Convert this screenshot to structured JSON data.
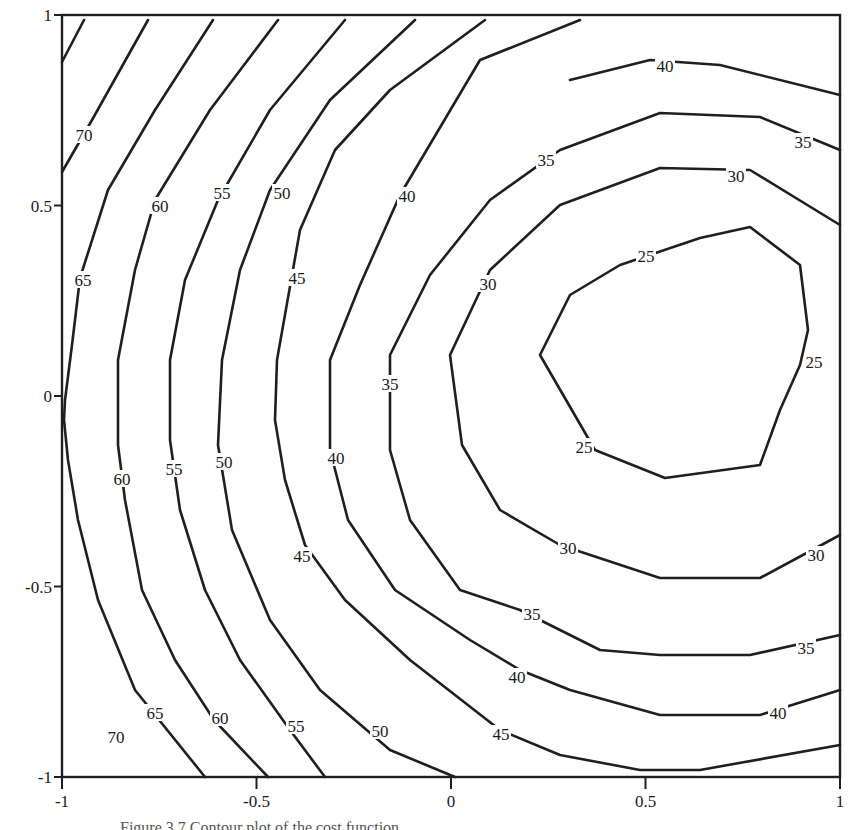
{
  "chart_data": {
    "type": "contour",
    "title": "",
    "xlabel": "",
    "ylabel": "",
    "xlim": [
      -1,
      1
    ],
    "ylim": [
      -1,
      1
    ],
    "x_ticks": [
      {
        "value": -1,
        "label": "-1"
      },
      {
        "value": -0.5,
        "label": "-0.5"
      },
      {
        "value": 0,
        "label": "0"
      },
      {
        "value": 0.5,
        "label": "0.5"
      },
      {
        "value": 1,
        "label": "1"
      }
    ],
    "y_ticks": [
      {
        "value": -1,
        "label": "-1"
      },
      {
        "value": -0.5,
        "label": "-0.5"
      },
      {
        "value": 0,
        "label": "0"
      },
      {
        "value": 0.5,
        "label": "0.5"
      },
      {
        "value": 1,
        "label": "1"
      }
    ],
    "grid": false,
    "contour_levels": [
      25,
      30,
      35,
      40,
      45,
      50,
      55,
      60,
      65,
      70
    ],
    "minimum_region": {
      "x": 0.55,
      "y": 0.1,
      "approx_value": "< 25"
    },
    "contours": [
      {
        "level": 70,
        "segment": "upper-left",
        "points_px": [
          [
            62,
            62
          ],
          [
            84,
            20
          ]
        ]
      },
      {
        "level": 70,
        "segment": "upper-left-2",
        "points_px": [
          [
            62,
            172
          ],
          [
            92,
            120
          ],
          [
            148,
            20
          ]
        ]
      },
      {
        "level": 65,
        "segment": "left",
        "points_px": [
          [
            213,
            20
          ],
          [
            155,
            110
          ],
          [
            108,
            190
          ],
          [
            80,
            278
          ],
          [
            72,
            345
          ],
          [
            65,
            400
          ],
          [
            64,
            420
          ],
          [
            68,
            460
          ],
          [
            78,
            520
          ],
          [
            98,
            600
          ],
          [
            135,
            690
          ],
          [
            205,
            777
          ]
        ]
      },
      {
        "level": 60,
        "segment": "left",
        "points_px": [
          [
            278,
            20
          ],
          [
            210,
            110
          ],
          [
            155,
            200
          ],
          [
            135,
            270
          ],
          [
            118,
            360
          ],
          [
            118,
            445
          ],
          [
            125,
            500
          ],
          [
            142,
            590
          ],
          [
            175,
            660
          ],
          [
            214,
            720
          ],
          [
            268,
            777
          ]
        ]
      },
      {
        "level": 55,
        "segment": "left",
        "points_px": [
          [
            345,
            20
          ],
          [
            270,
            110
          ],
          [
            218,
            200
          ],
          [
            185,
            280
          ],
          [
            170,
            360
          ],
          [
            170,
            440
          ],
          [
            180,
            510
          ],
          [
            205,
            590
          ],
          [
            240,
            660
          ],
          [
            290,
            730
          ],
          [
            325,
            777
          ]
        ]
      },
      {
        "level": 50,
        "segment": "left",
        "points_px": [
          [
            415,
            20
          ],
          [
            330,
            100
          ],
          [
            270,
            190
          ],
          [
            240,
            270
          ],
          [
            222,
            360
          ],
          [
            218,
            445
          ],
          [
            232,
            530
          ],
          [
            270,
            620
          ],
          [
            320,
            690
          ],
          [
            390,
            750
          ],
          [
            455,
            777
          ]
        ]
      },
      {
        "level": 45,
        "segment": "left",
        "points_px": [
          [
            485,
            20
          ],
          [
            390,
            90
          ],
          [
            335,
            150
          ],
          [
            300,
            230
          ],
          [
            277,
            360
          ],
          [
            275,
            420
          ],
          [
            285,
            480
          ],
          [
            305,
            545
          ],
          [
            345,
            600
          ],
          [
            410,
            660
          ],
          [
            500,
            730
          ],
          [
            560,
            755
          ],
          [
            640,
            770
          ],
          [
            700,
            770
          ],
          [
            840,
            745
          ]
        ]
      },
      {
        "level": 40,
        "segment": "full",
        "points_px": [
          [
            580,
            20
          ],
          [
            480,
            60
          ],
          [
            400,
            195
          ],
          [
            360,
            285
          ],
          [
            330,
            360
          ],
          [
            330,
            450
          ],
          [
            348,
            520
          ],
          [
            395,
            590
          ],
          [
            470,
            640
          ],
          [
            520,
            670
          ],
          [
            570,
            690
          ],
          [
            660,
            715
          ],
          [
            760,
            715
          ],
          [
            840,
            690
          ]
        ]
      },
      {
        "level": 40,
        "segment": "top-right",
        "points_px": [
          [
            570,
            80
          ],
          [
            650,
            60
          ],
          [
            720,
            65
          ],
          [
            840,
            95
          ]
        ]
      },
      {
        "level": 35,
        "segment": "full",
        "points_px": [
          [
            840,
            150
          ],
          [
            760,
            117
          ],
          [
            660,
            113
          ],
          [
            560,
            150
          ],
          [
            490,
            200
          ],
          [
            430,
            275
          ],
          [
            390,
            355
          ],
          [
            390,
            450
          ],
          [
            410,
            520
          ],
          [
            460,
            590
          ],
          [
            520,
            610
          ],
          [
            600,
            650
          ],
          [
            660,
            655
          ],
          [
            750,
            655
          ],
          [
            840,
            635
          ]
        ]
      },
      {
        "level": 30,
        "segment": "full",
        "points_px": [
          [
            840,
            225
          ],
          [
            750,
            170
          ],
          [
            660,
            168
          ],
          [
            560,
            205
          ],
          [
            490,
            270
          ],
          [
            450,
            355
          ],
          [
            462,
            445
          ],
          [
            500,
            510
          ],
          [
            560,
            545
          ],
          [
            660,
            578
          ],
          [
            760,
            578
          ],
          [
            840,
            535
          ]
        ]
      },
      {
        "level": 25,
        "segment": "closed",
        "points_px": [
          [
            540,
            355
          ],
          [
            570,
            295
          ],
          [
            620,
            265
          ],
          [
            700,
            238
          ],
          [
            750,
            227
          ],
          [
            800,
            265
          ],
          [
            808,
            330
          ],
          [
            800,
            365
          ],
          [
            780,
            410
          ],
          [
            760,
            465
          ],
          [
            665,
            478
          ],
          [
            595,
            450
          ],
          [
            540,
            355
          ]
        ]
      }
    ],
    "labels": [
      {
        "text": "70",
        "x": 84,
        "y": 135
      },
      {
        "text": "60",
        "x": 160,
        "y": 206
      },
      {
        "text": "55",
        "x": 222,
        "y": 193
      },
      {
        "text": "50",
        "x": 282,
        "y": 193
      },
      {
        "text": "40",
        "x": 407,
        "y": 196
      },
      {
        "text": "35",
        "x": 546,
        "y": 160
      },
      {
        "text": "40",
        "x": 665,
        "y": 66
      },
      {
        "text": "35",
        "x": 803,
        "y": 142
      },
      {
        "text": "30",
        "x": 736,
        "y": 176
      },
      {
        "text": "25",
        "x": 646,
        "y": 256
      },
      {
        "text": "65",
        "x": 83,
        "y": 280
      },
      {
        "text": "45",
        "x": 297,
        "y": 278
      },
      {
        "text": "30",
        "x": 488,
        "y": 284
      },
      {
        "text": "35",
        "x": 390,
        "y": 384
      },
      {
        "text": "25",
        "x": 814,
        "y": 362
      },
      {
        "text": "25",
        "x": 584,
        "y": 447
      },
      {
        "text": "60",
        "x": 122,
        "y": 479
      },
      {
        "text": "55",
        "x": 174,
        "y": 469
      },
      {
        "text": "50",
        "x": 224,
        "y": 462
      },
      {
        "text": "40",
        "x": 336,
        "y": 458
      },
      {
        "text": "45",
        "x": 302,
        "y": 556
      },
      {
        "text": "30",
        "x": 568,
        "y": 548
      },
      {
        "text": "30",
        "x": 816,
        "y": 555
      },
      {
        "text": "35",
        "x": 532,
        "y": 614
      },
      {
        "text": "35",
        "x": 806,
        "y": 648
      },
      {
        "text": "40",
        "x": 517,
        "y": 677
      },
      {
        "text": "40",
        "x": 778,
        "y": 713
      },
      {
        "text": "65",
        "x": 155,
        "y": 713
      },
      {
        "text": "60",
        "x": 220,
        "y": 718
      },
      {
        "text": "55",
        "x": 296,
        "y": 726
      },
      {
        "text": "50",
        "x": 380,
        "y": 731
      },
      {
        "text": "45",
        "x": 501,
        "y": 734
      },
      {
        "text": "70",
        "x": 116,
        "y": 737
      }
    ]
  },
  "caption": {
    "text": "Figure 3.7  Contour plot of the cost function"
  }
}
